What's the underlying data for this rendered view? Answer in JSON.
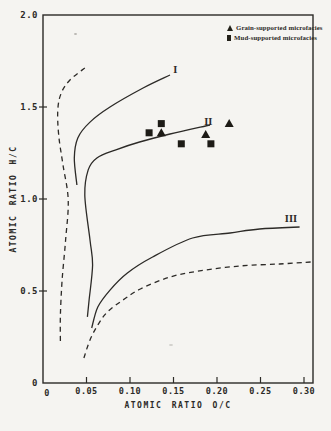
{
  "figure": {
    "background": "#f5f4f1",
    "ink": "#2c2a27"
  },
  "chart_data": {
    "type": "scatter",
    "title": "",
    "xlabel": "ATOMIC RATIO O/C",
    "ylabel": "ATOMIC RATIO H/C",
    "xlim": [
      0,
      0.3
    ],
    "ylim": [
      0,
      2.0
    ],
    "grid": false,
    "x_ticks": [
      {
        "value": 0,
        "label": "0"
      },
      {
        "value": 0.05,
        "label": "0.05"
      },
      {
        "value": 0.1,
        "label": "0.10"
      },
      {
        "value": 0.15,
        "label": "0.15"
      },
      {
        "value": 0.2,
        "label": "0.20"
      },
      {
        "value": 0.25,
        "label": "0.25"
      },
      {
        "value": 0.3,
        "label": "0.30"
      }
    ],
    "y_ticks": [
      {
        "value": 0,
        "label": "0"
      },
      {
        "value": 0.5,
        "label": "0.5"
      },
      {
        "value": 1.0,
        "label": "1.0"
      },
      {
        "value": 1.5,
        "label": "1.5"
      },
      {
        "value": 2.0,
        "label": "2.0"
      }
    ],
    "legend": {
      "position": "top-right",
      "entries": [
        {
          "marker": "triangle",
          "label": "Grain-supported microfacies"
        },
        {
          "marker": "square",
          "label": "Mud-supported microfacies"
        }
      ]
    },
    "series": [
      {
        "name": "Grain-supported microfacies",
        "marker": "triangle",
        "points": [
          [
            0.136,
            1.36
          ],
          [
            0.187,
            1.35
          ],
          [
            0.214,
            1.41
          ]
        ]
      },
      {
        "name": "Mud-supported microfacies",
        "marker": "square",
        "points": [
          [
            0.122,
            1.36
          ],
          [
            0.136,
            1.41
          ],
          [
            0.159,
            1.3
          ],
          [
            0.193,
            1.3
          ]
        ]
      }
    ],
    "curves": [
      {
        "name": "kerogen-type-I",
        "label": "I",
        "style": "solid",
        "label_pos": [
          0.152,
          1.7
        ],
        "points": [
          [
            0.039,
            1.076
          ],
          [
            0.036,
            1.223
          ],
          [
            0.04,
            1.332
          ],
          [
            0.054,
            1.418
          ],
          [
            0.077,
            1.5
          ],
          [
            0.115,
            1.603
          ],
          [
            0.146,
            1.674
          ]
        ]
      },
      {
        "name": "kerogen-type-II",
        "label": "II",
        "style": "solid",
        "label_pos": [
          0.19,
          1.42
        ],
        "points": [
          [
            0.051,
            0.359
          ],
          [
            0.053,
            0.451
          ],
          [
            0.057,
            0.641
          ],
          [
            0.054,
            0.777
          ],
          [
            0.048,
            1.022
          ],
          [
            0.052,
            1.158
          ],
          [
            0.062,
            1.223
          ],
          [
            0.083,
            1.266
          ],
          [
            0.111,
            1.31
          ],
          [
            0.146,
            1.353
          ],
          [
            0.192,
            1.402
          ]
        ]
      },
      {
        "name": "kerogen-type-III",
        "label": "III",
        "style": "solid",
        "label_pos": [
          0.285,
          0.89
        ],
        "points": [
          [
            0.056,
            0.299
          ],
          [
            0.063,
            0.413
          ],
          [
            0.077,
            0.505
          ],
          [
            0.097,
            0.598
          ],
          [
            0.126,
            0.685
          ],
          [
            0.172,
            0.788
          ],
          [
            0.215,
            0.815
          ],
          [
            0.249,
            0.837
          ],
          [
            0.295,
            0.848
          ]
        ]
      },
      {
        "name": "left-dashed-boundary",
        "label": "",
        "style": "dashed",
        "label_pos": null,
        "points": [
          [
            0.048,
            1.712
          ],
          [
            0.031,
            1.647
          ],
          [
            0.021,
            1.576
          ],
          [
            0.017,
            1.484
          ],
          [
            0.018,
            1.348
          ],
          [
            0.023,
            1.185
          ],
          [
            0.029,
            0.995
          ],
          [
            0.026,
            0.777
          ],
          [
            0.022,
            0.56
          ],
          [
            0.02,
            0.37
          ],
          [
            0.02,
            0.223
          ]
        ]
      },
      {
        "name": "lower-dashed-boundary",
        "label": "",
        "style": "dashed",
        "label_pos": null,
        "points": [
          [
            0.047,
            0.136
          ],
          [
            0.054,
            0.234
          ],
          [
            0.063,
            0.315
          ],
          [
            0.074,
            0.386
          ],
          [
            0.092,
            0.451
          ],
          [
            0.112,
            0.511
          ],
          [
            0.146,
            0.576
          ],
          [
            0.18,
            0.609
          ],
          [
            0.226,
            0.636
          ],
          [
            0.272,
            0.647
          ],
          [
            0.309,
            0.658
          ]
        ]
      }
    ]
  }
}
